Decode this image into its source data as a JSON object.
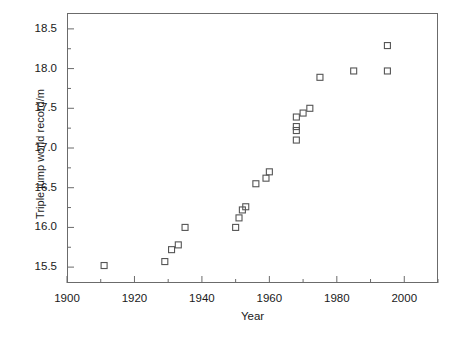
{
  "chart_data": {
    "type": "scatter",
    "title": "",
    "xlabel": "Year",
    "ylabel": "Triple jump world record/m",
    "xlim": [
      1900,
      2010
    ],
    "ylim": [
      15.3,
      18.7
    ],
    "grid": false,
    "legend": null,
    "marker": "open-square",
    "marker_color": "#555555",
    "axis_color": "#6b6b6b",
    "xticks": [
      1900,
      1920,
      1940,
      1960,
      1980,
      2000
    ],
    "xticklabels": [
      "1900",
      "1920",
      "1940",
      "1960",
      "1980",
      "2000"
    ],
    "xminorticks": [
      1910,
      1930,
      1950,
      1970,
      1990,
      2010
    ],
    "yticks": [
      15.5,
      16.0,
      16.5,
      17.0,
      17.5,
      18.0,
      18.5
    ],
    "yticklabels": [
      "15.5",
      "16.0",
      "16.5",
      "17.0",
      "17.5",
      "18.0",
      "18.5"
    ],
    "yminorticks": [
      15.75,
      16.25,
      16.75,
      17.25,
      17.75,
      18.25
    ],
    "x": [
      1911,
      1929,
      1931,
      1933,
      1935,
      1950,
      1951,
      1952,
      1953,
      1956,
      1959,
      1960,
      1968,
      1968,
      1968,
      1968,
      1970,
      1972,
      1975,
      1985,
      1995,
      1995
    ],
    "y": [
      15.52,
      15.57,
      15.72,
      15.78,
      16.0,
      16.0,
      16.12,
      16.22,
      16.26,
      16.55,
      16.62,
      16.7,
      17.1,
      17.22,
      17.27,
      17.39,
      17.44,
      17.5,
      17.89,
      17.97,
      17.97,
      18.29
    ],
    "points": [
      {
        "year": 1911,
        "record": 15.52
      },
      {
        "year": 1929,
        "record": 15.57
      },
      {
        "year": 1931,
        "record": 15.72
      },
      {
        "year": 1933,
        "record": 15.78
      },
      {
        "year": 1935,
        "record": 16.0
      },
      {
        "year": 1950,
        "record": 16.0
      },
      {
        "year": 1951,
        "record": 16.12
      },
      {
        "year": 1952,
        "record": 16.22
      },
      {
        "year": 1953,
        "record": 16.26
      },
      {
        "year": 1956,
        "record": 16.55
      },
      {
        "year": 1959,
        "record": 16.62
      },
      {
        "year": 1960,
        "record": 16.7
      },
      {
        "year": 1968,
        "record": 17.1
      },
      {
        "year": 1968,
        "record": 17.22
      },
      {
        "year": 1968,
        "record": 17.27
      },
      {
        "year": 1968,
        "record": 17.39
      },
      {
        "year": 1970,
        "record": 17.44
      },
      {
        "year": 1972,
        "record": 17.5
      },
      {
        "year": 1975,
        "record": 17.89
      },
      {
        "year": 1985,
        "record": 17.97
      },
      {
        "year": 1995,
        "record": 17.97
      },
      {
        "year": 1995,
        "record": 18.29
      }
    ]
  }
}
